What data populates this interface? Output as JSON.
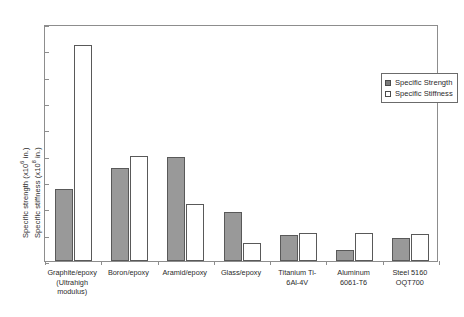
{
  "chart_data": {
    "type": "bar",
    "title": "",
    "xlabel": "",
    "ylabel_line1": "Specific strength (x10",
    "ylabel_line1_sup": "6",
    "ylabel_line1_end": " in.)",
    "ylabel_line2": "Specific stiffness (x10",
    "ylabel_line2_sup": "8",
    "ylabel_line2_end": " in.)",
    "ylim": [
      0,
      9
    ],
    "yticks": [
      0,
      1,
      2,
      3,
      4,
      5,
      6,
      7,
      8,
      9
    ],
    "ytick_labels": [
      "0",
      "1",
      "2",
      "3",
      "4",
      "5",
      "6",
      "7",
      "8",
      "9"
    ],
    "grid": false,
    "legend_position": "upper-right-inside",
    "categories": [
      "Graphite/epoxy (Ultrahigh modulus)",
      "Boron/epoxy",
      "Aramid/epoxy",
      "Glass/epoxy",
      "Titanium Ti-6Al-4V",
      "Aluminum 6061-T6",
      "Steel 5160 OQT700"
    ],
    "category_lines": [
      [
        "Graphite/epoxy",
        "(Ultrahigh",
        "modulus)"
      ],
      [
        "Boron/epoxy"
      ],
      [
        "Aramid/epoxy"
      ],
      [
        "Glass/epoxy"
      ],
      [
        "Titanium Ti-",
        "6Al-4V"
      ],
      [
        "Aluminum",
        "6061-T6"
      ],
      [
        "Steel 5160",
        "OQT700"
      ]
    ],
    "series": [
      {
        "name": "Specific Strength",
        "color": "#999999",
        "values": [
          2.75,
          3.55,
          3.95,
          1.85,
          0.97,
          0.4,
          0.88
        ]
      },
      {
        "name": "Specific Stiffness",
        "color": "#ffffff",
        "values": [
          8.2,
          4.0,
          2.15,
          0.7,
          1.05,
          1.05,
          1.03
        ]
      }
    ]
  },
  "legend": {
    "items": [
      {
        "label": "Specific Strength",
        "swatch": "fill"
      },
      {
        "label": "Specific Stiffness",
        "swatch": "open"
      }
    ]
  },
  "colors": {
    "bar_fill": "#999999",
    "bar_open": "#ffffff",
    "bar_edge": "#595959",
    "axis": "#8d8d8d",
    "text": "#2b2b2b",
    "background": "#ffffff"
  }
}
